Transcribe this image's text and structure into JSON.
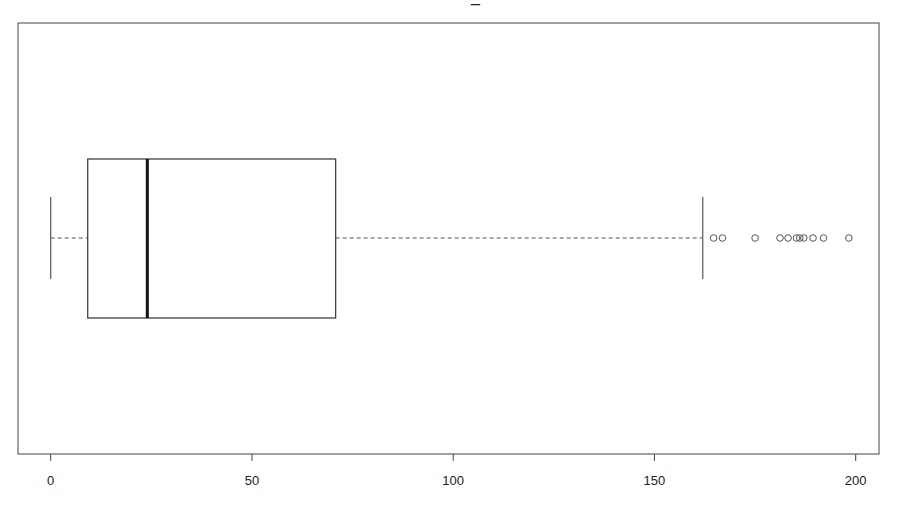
{
  "chart_data": {
    "type": "boxplot",
    "orientation": "horizontal",
    "title": "",
    "title_visible_fragment": "_",
    "xlabel": "",
    "ylabel": "",
    "xlim": [
      -8,
      207
    ],
    "x_ticks": [
      0,
      50,
      100,
      150,
      200
    ],
    "x_tick_labels": [
      "0",
      "50",
      "100",
      "150",
      "200"
    ],
    "grid": false,
    "legend": "none",
    "box": {
      "whisker_low": 0,
      "q1": 9.2,
      "median": 24.0,
      "q3": 70.8,
      "whisker_high": 162.0
    },
    "outliers": [
      164.7,
      166.9,
      175.0,
      181.2,
      183.2,
      185.3,
      186.1,
      187.1,
      189.4,
      192.0,
      198.3
    ],
    "colors": {
      "frame": "#444444",
      "box": "#333333",
      "median": "#111111",
      "whisker": "#555555",
      "outlier": "#555555"
    }
  }
}
